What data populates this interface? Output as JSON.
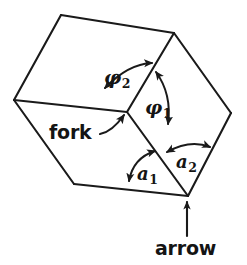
{
  "figure": {
    "type": "line-diagram",
    "background_color": "#ffffff",
    "ink_color": "#1a1a1a",
    "width": 247,
    "height": 265
  },
  "labels": {
    "fork": "fork",
    "arrow": "arrow",
    "phi2_base": "φ",
    "phi2_sub": "2",
    "phi1_base": "φ",
    "phi1_sub": "1",
    "a1_base": "a",
    "a1_sub": "1",
    "a2_base": "a",
    "a2_sub": "2"
  },
  "geometry": {
    "vertices": {
      "top_left": [
        61,
        15
      ],
      "top_right": [
        174,
        33
      ],
      "left": [
        14,
        100
      ],
      "right": [
        231,
        113
      ],
      "center_fork": [
        127,
        112
      ],
      "bottom_left": [
        74,
        184
      ],
      "bottom_arrow": [
        188,
        196
      ],
      "mid_arrow_junction": [
        158,
        158
      ]
    },
    "edges": [
      [
        "top_left",
        "top_right"
      ],
      [
        "top_left",
        "left"
      ],
      [
        "top_right",
        "right"
      ],
      [
        "left",
        "center_fork"
      ],
      [
        "top_right",
        "center_fork"
      ],
      [
        "left",
        "bottom_left"
      ],
      [
        "bottom_left",
        "bottom_arrow"
      ],
      [
        "right",
        "bottom_arrow"
      ],
      [
        "center_fork",
        "bottom_arrow"
      ]
    ]
  },
  "annotations": {
    "fork_pointer": "curved arrow from the word fork to the central Y junction",
    "arrow_pointer": "straight arrow pointing up to the bottom arrow junction",
    "phi2_arc": "double headed arc between top edge and vertical edge at fork",
    "phi1_arc": "double headed arc on the right side of the vertical edge",
    "a1_arc": "double headed arc at the lower left of the arrow junction",
    "a2_arc": "double headed arc at the lower right of the arrow junction"
  }
}
